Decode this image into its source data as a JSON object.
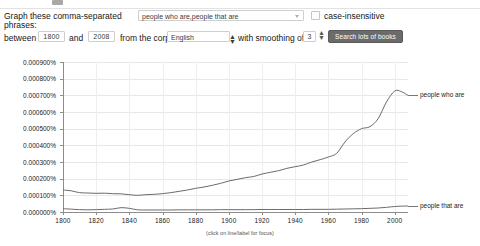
{
  "form": {
    "label_line1": "Graph these comma-separated",
    "label_line2": "phrases:",
    "phrases_value": "people who are,people that are",
    "case_insensitive_label": "case-insensitive",
    "case_insensitive_checked": false,
    "between_label": "between",
    "year_start": "1800",
    "and_label": "and",
    "year_end": "2008",
    "corpus_label": "from the corpus",
    "corpus_value": "English",
    "smoothing_label": "with smoothing of",
    "smoothing_value": "3",
    "search_button_label": "Search lots of books"
  },
  "chart_data": {
    "type": "line",
    "title": "",
    "xlabel": "",
    "ylabel": "",
    "caption": "(click on line/label for focus)",
    "grid": true,
    "legend_position": "right-inline",
    "xlim": [
      1800,
      2008
    ],
    "ylim": [
      0.0,
      0.0009
    ],
    "xticks": [
      1800,
      1820,
      1840,
      1860,
      1880,
      1900,
      1920,
      1940,
      1960,
      1980,
      2000
    ],
    "ytick_labels": [
      "0.000900%",
      "0.000800%",
      "0.000700%",
      "0.000600%",
      "0.000500%",
      "0.000400%",
      "0.000300%",
      "0.000200%",
      "0.000100%",
      "0.000000%"
    ],
    "ytick_values": [
      0.0009,
      0.0008,
      0.0007,
      0.0006,
      0.0005,
      0.0004,
      0.0003,
      0.0002,
      0.0001,
      0.0
    ],
    "x": [
      1800,
      1805,
      1810,
      1815,
      1820,
      1825,
      1830,
      1835,
      1840,
      1845,
      1850,
      1855,
      1860,
      1865,
      1870,
      1875,
      1880,
      1885,
      1890,
      1895,
      1900,
      1905,
      1910,
      1915,
      1920,
      1925,
      1930,
      1935,
      1940,
      1945,
      1950,
      1955,
      1960,
      1965,
      1970,
      1975,
      1980,
      1985,
      1990,
      1995,
      2000,
      2004,
      2008
    ],
    "series": [
      {
        "name": "people who are",
        "color": "#6b6b6b",
        "values": [
          0.000132,
          0.000127,
          0.000116,
          0.000114,
          0.000112,
          0.000113,
          0.00011,
          0.000109,
          0.000104,
          0.0001,
          0.000104,
          0.000106,
          0.00011,
          0.000116,
          0.000124,
          0.000132,
          0.000142,
          0.00015,
          0.00016,
          0.000172,
          0.000186,
          0.000196,
          0.000206,
          0.000213,
          0.000228,
          0.000238,
          0.000248,
          0.000262,
          0.000272,
          0.000282,
          0.0003,
          0.000314,
          0.00033,
          0.000352,
          0.00042,
          0.00047,
          0.0005,
          0.000512,
          0.00056,
          0.00066,
          0.000726,
          0.000722,
          0.0007
        ]
      },
      {
        "name": "people that are",
        "color": "#6b6b6b",
        "values": [
          2e-05,
          1.7e-05,
          1.4e-05,
          1.3e-05,
          1.4e-05,
          1.6e-05,
          1.8e-05,
          2.6e-05,
          2.2e-05,
          1.3e-05,
          1.2e-05,
          1.2e-05,
          1.2e-05,
          1.2e-05,
          1.3e-05,
          1.3e-05,
          1.3e-05,
          1.3e-05,
          1.3e-05,
          1.4e-05,
          1.4e-05,
          1.4e-05,
          1.4e-05,
          1.4e-05,
          1.5e-05,
          1.5e-05,
          1.5e-05,
          1.5e-05,
          1.5e-05,
          1.5e-05,
          1.6e-05,
          1.6e-05,
          1.6e-05,
          1.7e-05,
          1.8e-05,
          1.9e-05,
          2e-05,
          2.2e-05,
          2.4e-05,
          2.8e-05,
          3.3e-05,
          3.5e-05,
          3.6e-05
        ]
      }
    ]
  }
}
